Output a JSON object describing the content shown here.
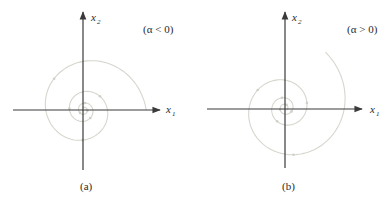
{
  "panels": [
    {
      "id": "a",
      "caption": "(a)",
      "condition": "(α < 0)",
      "x_axis_label": {
        "var": "x",
        "sub": "1"
      },
      "y_axis_label": {
        "var": "x",
        "sub": "2"
      },
      "behavior": "stable focus (spiral inward)",
      "spiral_direction": "inward"
    },
    {
      "id": "b",
      "caption": "(b)",
      "condition": "(α > 0)",
      "x_axis_label": {
        "var": "x",
        "sub": "1"
      },
      "y_axis_label": {
        "var": "x",
        "sub": "2"
      },
      "behavior": "unstable focus (spiral outward)",
      "spiral_direction": "outward"
    }
  ],
  "colors": {
    "axis": "#3a3a3a",
    "trajectory": "#d6d6cf",
    "text": "#2a2a2a"
  }
}
